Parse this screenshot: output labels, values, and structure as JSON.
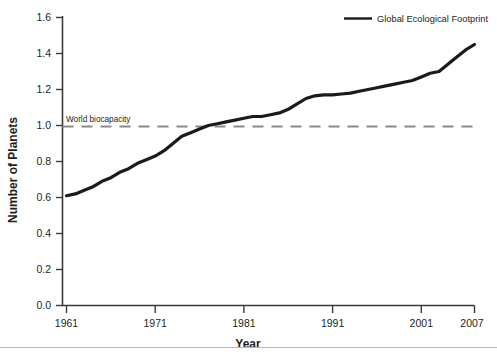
{
  "chart_data": {
    "type": "line",
    "title": "",
    "xlabel": "Year",
    "ylabel": "Number of Planets",
    "xlim": [
      1961,
      2007
    ],
    "ylim": [
      0.0,
      1.6
    ],
    "grid": false,
    "legend_position": "top-right",
    "legend": [
      "Global Ecological Footprint"
    ],
    "xticks": [
      "1961",
      "1971",
      "1981",
      "1991",
      "2001",
      "2007"
    ],
    "xtick_values": [
      1961,
      1971,
      1981,
      1991,
      2001,
      2007
    ],
    "yticks": [
      "0.0",
      "0.2",
      "0.4",
      "0.6",
      "0.8",
      "1.0",
      "1.2",
      "1.4",
      "1.6"
    ],
    "ytick_values": [
      0.0,
      0.2,
      0.4,
      0.6,
      0.8,
      1.0,
      1.2,
      1.4,
      1.6
    ],
    "annotations": [
      {
        "text": "World biocapacity",
        "value": 1.0,
        "style": "dashed-horizontal-line",
        "color": "#8a8a8a"
      }
    ],
    "series": [
      {
        "name": "Global Ecological Footprint",
        "color": "#1a1a1a",
        "x": [
          1961,
          1962,
          1963,
          1964,
          1965,
          1966,
          1967,
          1968,
          1969,
          1970,
          1971,
          1972,
          1973,
          1974,
          1975,
          1976,
          1977,
          1978,
          1979,
          1980,
          1981,
          1982,
          1983,
          1984,
          1985,
          1986,
          1987,
          1988,
          1989,
          1990,
          1991,
          1992,
          1993,
          1994,
          1995,
          1996,
          1997,
          1998,
          1999,
          2000,
          2001,
          2002,
          2003,
          2004,
          2005,
          2006,
          2007
        ],
        "values": [
          0.61,
          0.62,
          0.64,
          0.66,
          0.69,
          0.71,
          0.74,
          0.76,
          0.79,
          0.81,
          0.83,
          0.86,
          0.9,
          0.94,
          0.96,
          0.98,
          1.0,
          1.01,
          1.02,
          1.03,
          1.04,
          1.05,
          1.05,
          1.06,
          1.07,
          1.09,
          1.12,
          1.15,
          1.165,
          1.17,
          1.17,
          1.175,
          1.18,
          1.19,
          1.2,
          1.21,
          1.22,
          1.23,
          1.24,
          1.25,
          1.27,
          1.29,
          1.3,
          1.34,
          1.38,
          1.42,
          1.45
        ]
      }
    ]
  },
  "axes": {
    "y_title": "Number of Planets",
    "x_title": "Year"
  },
  "legend": {
    "entries": [
      {
        "label": "Global Ecological Footprint",
        "color": "#1a1a1a",
        "marker": "line"
      }
    ]
  },
  "annotation": {
    "biocapacity_label": "World biocapacity"
  }
}
